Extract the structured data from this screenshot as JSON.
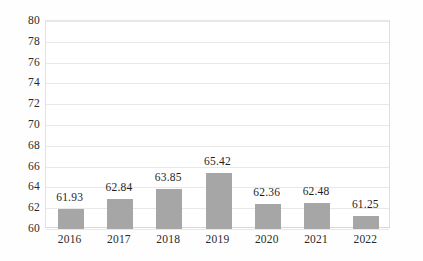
{
  "chart_data": {
    "type": "bar",
    "title": "",
    "subtitle": "",
    "xlabel": "",
    "ylabel": "",
    "categories": [
      "2016",
      "2017",
      "2018",
      "2019",
      "2020",
      "2021",
      "2022"
    ],
    "values": [
      61.93,
      62.84,
      63.85,
      65.42,
      62.36,
      62.48,
      61.25
    ],
    "data_labels": [
      "61.93",
      "62.84",
      "63.85",
      "65.42",
      "62.36",
      "62.48",
      "61.25"
    ],
    "ylim": [
      60,
      80
    ],
    "ytick_step": 2,
    "ytick_labels": [
      "80",
      "78",
      "76",
      "74",
      "72",
      "70",
      "68",
      "66",
      "64",
      "62",
      "60"
    ],
    "grid": true,
    "grid_axis": "y",
    "legend": null,
    "legend_position": "none",
    "series": [
      {
        "name": "",
        "values": [
          61.93,
          62.84,
          63.85,
          65.42,
          62.36,
          62.48,
          61.25
        ]
      }
    ],
    "colors": {
      "bar_fill": "#a6a6a6",
      "gridline": "#e8e8e8",
      "axis_line": "#e0e0e0",
      "text": "#2a2a2a",
      "background": "#ffffff"
    }
  }
}
